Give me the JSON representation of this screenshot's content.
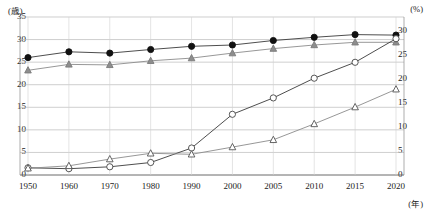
{
  "chart_data": {
    "type": "line",
    "title": "",
    "xlabel": "(年)",
    "ylabel": "(歳)",
    "y2label": "(%)",
    "categories": [
      "1950",
      "1960",
      "1970",
      "1980",
      "1990",
      "2000",
      "2005",
      "2010",
      "2015",
      "2020"
    ],
    "x_tick_labels": [
      "1950",
      "1960",
      "1970",
      "1980",
      "1990",
      "2000",
      "2005",
      "2010",
      "2015",
      "2020"
    ],
    "y_tick_labels": [
      "35",
      "30",
      "25",
      "20",
      "15",
      "10",
      "5",
      "0"
    ],
    "y2_tick_labels": [
      "30",
      "25",
      "20",
      "15",
      "10",
      "5",
      "0"
    ],
    "ylim": [
      0,
      35
    ],
    "y2lim": [
      0,
      30
    ],
    "grid": true,
    "legend_position": "none",
    "series": [
      {
        "name": "男性 平均初婚年齢",
        "marker": "filled-circle",
        "axis": "left",
        "unit": "歳",
        "values": [
          26.0,
          27.3,
          27.0,
          27.8,
          28.5,
          28.8,
          29.8,
          30.5,
          31.1,
          31.0
        ]
      },
      {
        "name": "女性 平均初婚年齢",
        "marker": "filled-triangle",
        "axis": "left",
        "unit": "歳",
        "values": [
          23.2,
          24.5,
          24.4,
          25.3,
          25.9,
          27.0,
          28.0,
          28.8,
          29.4,
          29.4
        ]
      },
      {
        "name": "男性 生涯未婚率",
        "marker": "open-circle",
        "axis": "right",
        "unit": "%",
        "values": [
          1.5,
          1.3,
          1.7,
          2.6,
          5.6,
          12.6,
          16.0,
          20.1,
          23.4,
          28.3
        ]
      },
      {
        "name": "女性 生涯未婚率",
        "marker": "open-triangle",
        "axis": "right",
        "unit": "%",
        "values": [
          1.4,
          1.9,
          3.3,
          4.5,
          4.3,
          5.8,
          7.3,
          10.6,
          14.1,
          17.8
        ]
      }
    ]
  },
  "axes": {
    "left_unit": "(歳)",
    "right_unit": "(%)",
    "x_unit": "(年)"
  },
  "caption": ""
}
